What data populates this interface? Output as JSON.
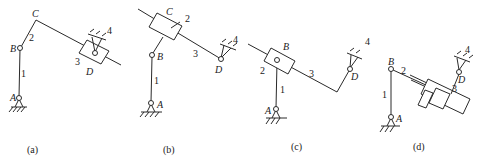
{
  "figure": {
    "panels": [
      {
        "id": "a",
        "caption": "(a)",
        "points": {
          "A": "A",
          "B": "B",
          "C": "C",
          "D": "D"
        },
        "links": {
          "l1": "1",
          "l2": "2",
          "l3": "3",
          "l4": "4"
        }
      },
      {
        "id": "b",
        "caption": "(b)",
        "points": {
          "A": "A",
          "B": "B",
          "C": "C",
          "D": "D"
        },
        "links": {
          "l1": "1",
          "l2": "2",
          "l3": "3",
          "l4": "4"
        }
      },
      {
        "id": "c",
        "caption": "(c)",
        "points": {
          "A": "A",
          "B": "B",
          "D": "D"
        },
        "links": {
          "l1": "1",
          "l2": "2",
          "l3": "3",
          "l4": "4"
        }
      },
      {
        "id": "d",
        "caption": "(d)",
        "points": {
          "A": "A",
          "B": "B",
          "D": "D"
        },
        "links": {
          "l1": "1",
          "l2": "2",
          "l3": "3",
          "l4": "4"
        }
      }
    ]
  }
}
